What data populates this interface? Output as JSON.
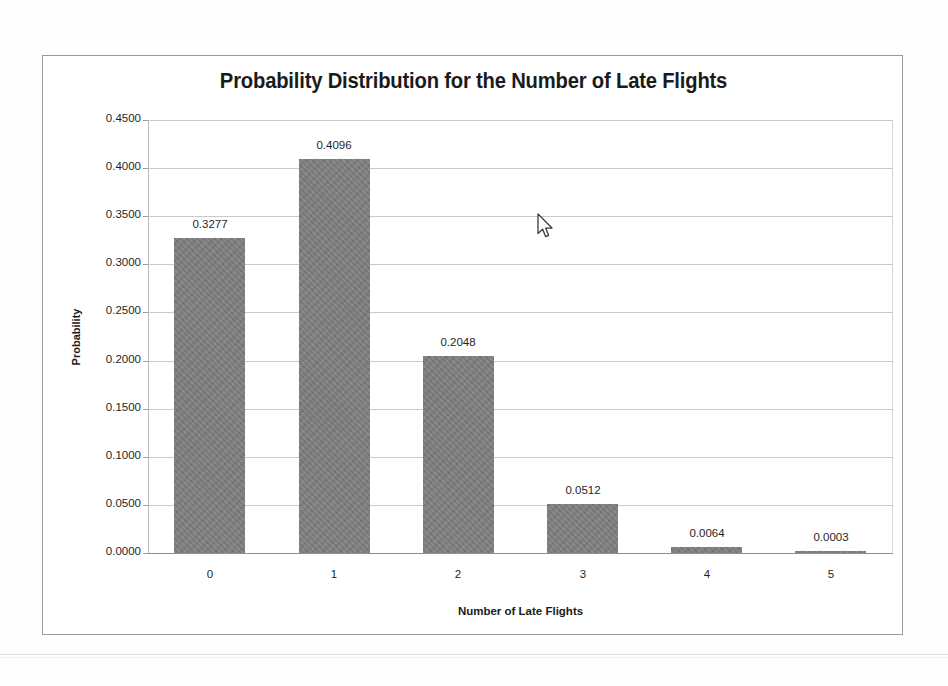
{
  "chart_data": {
    "type": "bar",
    "title": "Probability Distribution for the Number of Late Flights",
    "xlabel": "Number of Late Flights",
    "ylabel": "Probability",
    "categories": [
      "0",
      "1",
      "2",
      "3",
      "4",
      "5"
    ],
    "values": [
      0.3277,
      0.4096,
      0.2048,
      0.0512,
      0.0064,
      0.0003
    ],
    "value_labels": [
      "0.3277",
      "0.4096",
      "0.2048",
      "0.0512",
      "0.0064",
      "0.0003"
    ],
    "ylim": [
      0.0,
      0.45
    ],
    "ytick_values": [
      0.45,
      0.4,
      0.35,
      0.3,
      0.25,
      0.2,
      0.15,
      0.1,
      0.05,
      0.0
    ],
    "ytick_labels": [
      "0.4500",
      "0.4000",
      "0.3500",
      "0.3000",
      "0.2500",
      "0.2000",
      "0.1500",
      "0.1000",
      "0.0500",
      "0.0000"
    ],
    "grid": true,
    "legend": false,
    "series": [
      {
        "name": "Probability",
        "values": [
          0.3277,
          0.4096,
          0.2048,
          0.0512,
          0.0064,
          0.0003
        ]
      }
    ],
    "colors": {
      "bar_fill": "#7e7e7e",
      "gridline": "#c9c9c9",
      "axis_line": "#8f8f8f",
      "text": "#1f1f1f",
      "chart_border": "#9a9a9a",
      "background": "#ffffff"
    }
  },
  "cursor": {
    "icon": "arrow-pointer-icon",
    "x": 541,
    "y": 219
  }
}
